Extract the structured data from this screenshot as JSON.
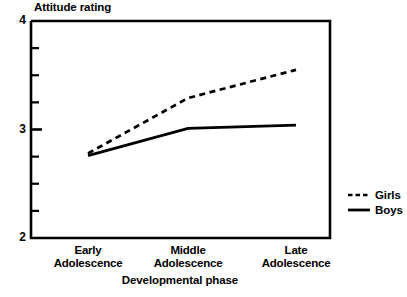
{
  "chart_data": {
    "type": "line",
    "title": "",
    "xlabel": "Developmental phase",
    "ylabel": "Attitude rating",
    "categories": [
      "Early Adolescence",
      "Middle Adolescence",
      "Late Adolescence"
    ],
    "category_lines": [
      [
        "Early",
        "Adolescence"
      ],
      [
        "Middle",
        "Adolescence"
      ],
      [
        "Late",
        "Adolescence"
      ]
    ],
    "series": [
      {
        "name": "Girls",
        "style": "dashed",
        "values": [
          2.78,
          3.29,
          3.55
        ]
      },
      {
        "name": "Boys",
        "style": "solid",
        "values": [
          2.76,
          3.01,
          3.04
        ]
      }
    ],
    "ylim": [
      2,
      4
    ],
    "ytick_labels": [
      "2",
      "3",
      "4"
    ],
    "ytick_values": [
      2,
      3,
      4
    ],
    "yminor_step": 0.25,
    "grid": false,
    "legend_position": "right",
    "line_color": "#000000"
  },
  "axis": {
    "y_title": "Attitude rating",
    "x_title": "Developmental phase",
    "y_max_label": "4",
    "y_mid_label": "3",
    "y_min_label": "2"
  },
  "legend": {
    "entries": [
      {
        "label": "Girls"
      },
      {
        "label": "Boys"
      }
    ]
  }
}
